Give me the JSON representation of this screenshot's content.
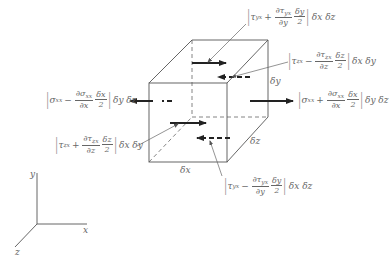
{
  "diagram": {
    "equations": {
      "sigma_left": {
        "sym": "σ",
        "sub": "xx",
        "op": "−",
        "dnum": "∂σ",
        "dnum_sub": "xx",
        "dden": "∂x",
        "hnum": "δx",
        "hden": "2",
        "tail": "δy δz"
      },
      "sigma_right": {
        "sym": "σ",
        "sub": "xx",
        "op": "+",
        "dnum": "∂σ",
        "dnum_sub": "xx",
        "dden": "∂x",
        "hnum": "δx",
        "hden": "2",
        "tail": "δy δz"
      },
      "tau_yx_top": {
        "sym": "τ",
        "sub": "yx",
        "op": "+",
        "dnum": "∂τ",
        "dnum_sub": "yx",
        "dden": "∂y",
        "hnum": "δy",
        "hden": "2",
        "tail": "δx δz"
      },
      "tau_yx_bot": {
        "sym": "τ",
        "sub": "yx",
        "op": "−",
        "dnum": "∂τ",
        "dnum_sub": "yx",
        "dden": "∂y",
        "hnum": "δy",
        "hden": "2",
        "tail": "δx δz"
      },
      "tau_zx_back": {
        "sym": "τ",
        "sub": "zx",
        "op": "−",
        "dnum": "∂τ",
        "dnum_sub": "zx",
        "dden": "∂z",
        "hnum": "δz",
        "hden": "2",
        "tail": "δx δy"
      },
      "tau_zx_front": {
        "sym": "τ",
        "sub": "zx",
        "op": "+",
        "dnum": "∂τ",
        "dnum_sub": "zx",
        "dden": "∂z",
        "hnum": "δz",
        "hden": "2",
        "tail": "δx δy"
      }
    },
    "dimensions": {
      "dx": "δx",
      "dy": "δy",
      "dz": "δz"
    },
    "axes": {
      "x": "x",
      "y": "y",
      "z": "z"
    },
    "colors": {
      "line": "#555555",
      "arrow": "#222222",
      "text": "#666666"
    }
  }
}
